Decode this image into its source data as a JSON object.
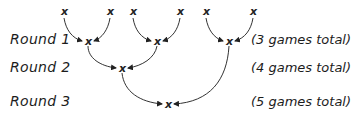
{
  "rounds": [
    {
      "label": "Round 1",
      "note": "(3 games total)"
    },
    {
      "label": "Round 2",
      "note": "(4 games total)"
    },
    {
      "label": "Round 3",
      "note": "(5 games total)"
    }
  ],
  "marker": "x"
}
